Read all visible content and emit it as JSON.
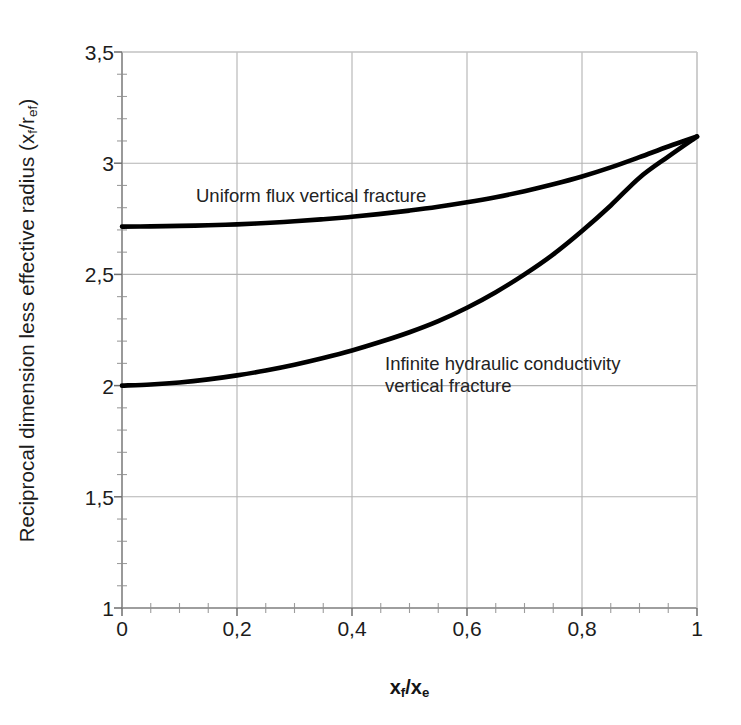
{
  "chart_data": {
    "type": "line",
    "title": "",
    "subtitle": "",
    "xlabel_html": "x<sub>f</sub>/x<sub>e</sub>",
    "xlabel_text": "xf/xe",
    "ylabel_html": "Reciprocal dimension less effective radius (x<sub>f</sub>/r<sub>ef</sub>)",
    "ylabel_text": "Reciprocal dimension less effective radius (xf/ref)",
    "xlim": [
      0,
      1
    ],
    "ylim": [
      1,
      3.5
    ],
    "xticks": [
      0,
      0.2,
      0.4,
      0.6,
      0.8,
      1
    ],
    "xtick_labels": [
      "0",
      "0,2",
      "0,4",
      "0,6",
      "0,8",
      "1"
    ],
    "yticks": [
      1,
      1.5,
      2,
      2.5,
      3,
      3.5
    ],
    "ytick_labels": [
      "1",
      "1,5",
      "2",
      "2,5",
      "3",
      "3,5"
    ],
    "minor_ytick_interval": 0.1,
    "minor_xtick_interval": 0.05,
    "grid": true,
    "grid_color": "#b3b3b3",
    "legend_position": "inline-annotations",
    "line_color": "#000000",
    "line_width": 4.5,
    "series": [
      {
        "name": "Uniform flux vertical fracture",
        "annotation": "Uniform flux vertical fracture",
        "x": [
          0,
          0.05,
          0.1,
          0.15,
          0.2,
          0.25,
          0.3,
          0.35,
          0.4,
          0.45,
          0.5,
          0.55,
          0.6,
          0.65,
          0.7,
          0.75,
          0.8,
          0.85,
          0.9,
          0.95,
          1
        ],
        "values": [
          2.715,
          2.716,
          2.718,
          2.721,
          2.725,
          2.731,
          2.739,
          2.748,
          2.759,
          2.772,
          2.787,
          2.804,
          2.824,
          2.847,
          2.874,
          2.905,
          2.94,
          2.981,
          3.027,
          3.075,
          3.12
        ]
      },
      {
        "name": "Infinite hydraulic conductivity vertical fracture",
        "annotation_line1": "Infinite hydraulic conductivity",
        "annotation_line2": "vertical fracture",
        "x": [
          0,
          0.05,
          0.1,
          0.15,
          0.2,
          0.25,
          0.3,
          0.35,
          0.4,
          0.45,
          0.5,
          0.55,
          0.6,
          0.65,
          0.7,
          0.75,
          0.8,
          0.85,
          0.9,
          0.95,
          1
        ],
        "values": [
          2.0,
          2.005,
          2.014,
          2.028,
          2.046,
          2.068,
          2.094,
          2.124,
          2.158,
          2.197,
          2.24,
          2.29,
          2.35,
          2.42,
          2.5,
          2.59,
          2.695,
          2.81,
          2.935,
          3.03,
          3.12
        ]
      }
    ]
  },
  "axes": {
    "xtick_labels": [
      "0",
      "0,2",
      "0,4",
      "0,6",
      "0,8",
      "1"
    ],
    "ytick_labels": [
      "1",
      "1,5",
      "2",
      "2,5",
      "3",
      "3,5"
    ]
  },
  "annotations": {
    "uniform": "Uniform flux vertical fracture",
    "infinite_line1": "Infinite hydraulic conductivity",
    "infinite_line2": "vertical fracture"
  }
}
